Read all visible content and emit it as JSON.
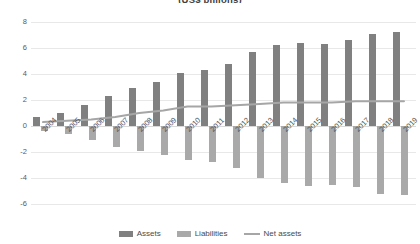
{
  "chart_data": {
    "type": "bar",
    "title": "(US$ billions)",
    "xlabel": "",
    "ylabel": "",
    "ylim": [
      -6,
      8
    ],
    "yticks": [
      8,
      6,
      4,
      2,
      0,
      -2,
      -4,
      -6
    ],
    "grid": true,
    "legend_position": "bottom",
    "categories": [
      "2004",
      "2005",
      "2006",
      "2007",
      "2008",
      "2009",
      "2010",
      "2011",
      "2012",
      "2013",
      "2014",
      "2015",
      "2016",
      "2017",
      "2018",
      "2019"
    ],
    "series": [
      {
        "name": "Assets",
        "color": "#808080",
        "values": [
          0.7,
          1.0,
          1.6,
          2.3,
          2.9,
          3.4,
          4.1,
          4.3,
          4.8,
          5.7,
          6.2,
          6.4,
          6.3,
          6.6,
          7.1,
          7.2
        ]
      },
      {
        "name": "Liabilities",
        "color": "#a9a9a9",
        "values": [
          -0.4,
          -0.6,
          -1.1,
          -1.6,
          -1.9,
          -2.2,
          -2.6,
          -2.8,
          -3.2,
          -4.0,
          -4.4,
          -4.6,
          -4.5,
          -4.7,
          -5.2,
          -5.3
        ]
      },
      {
        "name": "Net assets",
        "color": "#a6a6a6",
        "type": "line",
        "values": [
          0.3,
          0.4,
          0.5,
          0.7,
          1.0,
          1.2,
          1.5,
          1.5,
          1.6,
          1.7,
          1.8,
          1.8,
          1.8,
          1.9,
          1.9,
          1.9
        ]
      }
    ]
  },
  "legend": {
    "assets_label": "Assets",
    "liabilities_label": "Liabilities",
    "net_assets_label": "Net assets"
  }
}
